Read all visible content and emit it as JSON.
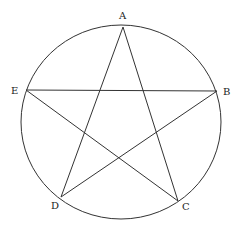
{
  "diagram": {
    "type": "pentagram inscribed in circle",
    "stroke_color": "#333333",
    "circle": {
      "cx": 121,
      "cy": 122,
      "rx": 100,
      "ry": 97
    },
    "points": [
      {
        "name": "A",
        "x": 123,
        "y": 27,
        "label_x": 119,
        "label_y": 11
      },
      {
        "name": "B",
        "x": 217,
        "y": 91,
        "label_x": 223,
        "label_y": 87
      },
      {
        "name": "C",
        "x": 178,
        "y": 201,
        "label_x": 182,
        "label_y": 202
      },
      {
        "name": "D",
        "x": 61,
        "y": 197,
        "label_x": 51,
        "label_y": 201
      },
      {
        "name": "E",
        "x": 26,
        "y": 90,
        "label_x": 11,
        "label_y": 86
      }
    ],
    "segments": [
      [
        "A",
        "C"
      ],
      [
        "A",
        "D"
      ],
      [
        "E",
        "B"
      ],
      [
        "E",
        "C"
      ],
      [
        "D",
        "B"
      ]
    ]
  }
}
